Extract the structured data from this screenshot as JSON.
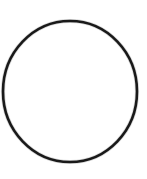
{
  "image": {
    "width": 147,
    "height": 179,
    "background_color": "#ffffff",
    "subject_name": "o-ring-circle-outline",
    "caption": ""
  },
  "shape": {
    "kind": "circle-outline",
    "icon_name": "circle-outline-icon",
    "center_x": 70,
    "center_y": 91.5,
    "radius_x": 67,
    "radius_y": 70.5,
    "stroke_color": "#1a1a1a",
    "stroke_width": 2.6,
    "fill_color": "#ffffff",
    "bounds": {
      "left": 3,
      "top": 21,
      "right": 137,
      "bottom": 162
    }
  }
}
